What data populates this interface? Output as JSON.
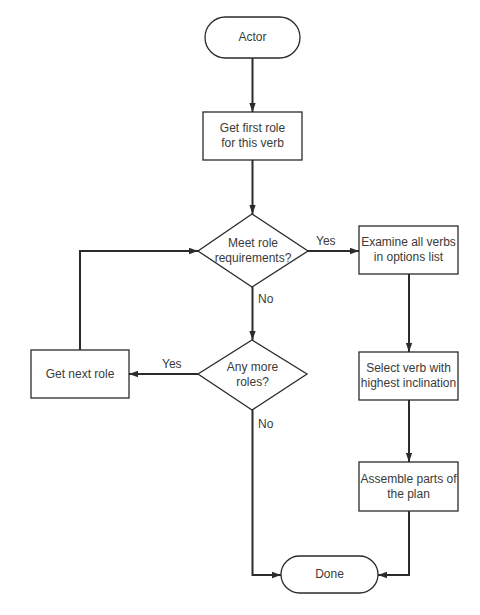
{
  "diagram": {
    "type": "flowchart",
    "colors": {
      "stroke": "#2b2b2b",
      "text": "#3a3a3a",
      "background": "#ffffff"
    },
    "nodes": {
      "actor": {
        "shape": "terminal",
        "label": "Actor"
      },
      "get_first_role": {
        "shape": "process",
        "label": "Get first role for this verb",
        "line1": "Get first role",
        "line2": "for this verb"
      },
      "meet_requirements": {
        "shape": "decision",
        "label": "Meet role requirements?",
        "line1": "Meet role",
        "line2": "requirements?"
      },
      "any_more_roles": {
        "shape": "decision",
        "label": "Any more roles?",
        "line1": "Any more",
        "line2": "roles?"
      },
      "get_next_role": {
        "shape": "process",
        "label": "Get next role"
      },
      "examine_verbs": {
        "shape": "process",
        "label": "Examine all verbs in options list",
        "line1": "Examine all verbs",
        "line2": "in options list"
      },
      "select_verb": {
        "shape": "process",
        "label": "Select verb with highest inclination",
        "line1": "Select verb with",
        "line2": "highest inclination"
      },
      "assemble_plan": {
        "shape": "process",
        "label": "Assemble parts of the plan",
        "line1": "Assemble parts of",
        "line2": "the plan"
      },
      "done": {
        "shape": "terminal",
        "label": "Done"
      }
    },
    "edges": [
      {
        "from": "actor",
        "to": "get_first_role",
        "label": ""
      },
      {
        "from": "get_first_role",
        "to": "meet_requirements",
        "label": ""
      },
      {
        "from": "meet_requirements",
        "to": "examine_verbs",
        "label": "Yes"
      },
      {
        "from": "meet_requirements",
        "to": "any_more_roles",
        "label": "No"
      },
      {
        "from": "any_more_roles",
        "to": "get_next_role",
        "label": "Yes"
      },
      {
        "from": "any_more_roles",
        "to": "done",
        "label": "No"
      },
      {
        "from": "get_next_role",
        "to": "meet_requirements",
        "label": ""
      },
      {
        "from": "examine_verbs",
        "to": "select_verb",
        "label": ""
      },
      {
        "from": "select_verb",
        "to": "assemble_plan",
        "label": ""
      },
      {
        "from": "assemble_plan",
        "to": "done",
        "label": ""
      }
    ],
    "edge_labels": {
      "meet_yes": "Yes",
      "meet_no": "No",
      "more_yes": "Yes",
      "more_no": "No"
    }
  }
}
